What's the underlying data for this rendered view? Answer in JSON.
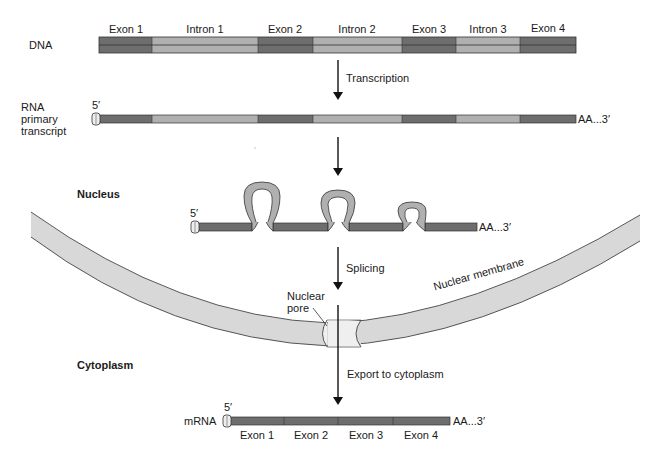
{
  "diagram": {
    "colors": {
      "exon": "#6e6e6e",
      "intron": "#b0b0b0",
      "membrane": "#d8d8d8",
      "pore": "#ececec",
      "outline": "#333333",
      "arrow": "#111111"
    },
    "dna": {
      "label": "DNA",
      "segments": [
        {
          "label": "Exon 1",
          "type": "exon"
        },
        {
          "label": "Intron 1",
          "type": "intron"
        },
        {
          "label": "Exon 2",
          "type": "exon"
        },
        {
          "label": "Intron 2",
          "type": "intron"
        },
        {
          "label": "Exon 3",
          "type": "exon"
        },
        {
          "label": "Intron 3",
          "type": "intron"
        },
        {
          "label": "Exon 4",
          "type": "exon"
        }
      ]
    },
    "steps": {
      "transcription": "Transcription",
      "splicing": "Splicing",
      "export": "Export to cytoplasm"
    },
    "primary_transcript": {
      "label_line1": "RNA",
      "label_line2": "primary",
      "label_line3": "transcript",
      "five_prime": "5′",
      "three_prime": "AA...3′"
    },
    "nucleus": {
      "label": "Nucleus",
      "five_prime": "5′",
      "three_prime": "AA...3′"
    },
    "membrane": {
      "label": "Nuclear membrane",
      "pore_line1": "Nuclear",
      "pore_line2": "pore"
    },
    "cytoplasm": {
      "label": "Cytoplasm"
    },
    "mrna": {
      "label": "mRNA",
      "five_prime": "5′",
      "three_prime": "AA...3′",
      "exons": [
        "Exon 1",
        "Exon 2",
        "Exon 3",
        "Exon 4"
      ]
    }
  }
}
